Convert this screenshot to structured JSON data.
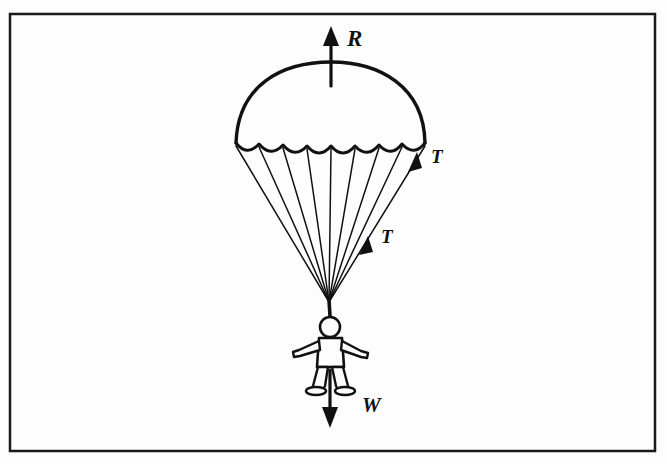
{
  "figure": {
    "background_color": "#fdfdfd",
    "ink_color": "#111111",
    "border": {
      "name": "figure-frame",
      "x": 10,
      "y": 14,
      "width": 645,
      "height": 437,
      "stroke_width": 2.5,
      "color": "#1a1a1a"
    },
    "labels": [
      {
        "id": "R",
        "text": "R",
        "x": 347,
        "y": 46,
        "meaning": "air-resistance-upward"
      },
      {
        "id": "T1",
        "text": "T",
        "x": 431,
        "y": 163,
        "meaning": "tension-in-suspension-line-upper"
      },
      {
        "id": "T2",
        "text": "T",
        "x": 381,
        "y": 243,
        "meaning": "tension-in-suspension-line-lower"
      },
      {
        "id": "W",
        "text": "W",
        "x": 362,
        "y": 412,
        "meaning": "weight-downward"
      }
    ],
    "canopy": {
      "name": "parachute-canopy",
      "apex_x": 331,
      "apex_y": 62,
      "left_x": 236,
      "right_x": 426,
      "skirt_y": 142,
      "scallop_count": 8
    },
    "lines": {
      "name": "suspension-lines",
      "count": 9,
      "converge_x": 329,
      "converge_y": 302
    },
    "arrows": {
      "resistance": {
        "name": "arrow-R",
        "x": 331,
        "y_tail": 86,
        "y_head": 28,
        "direction": "up"
      },
      "weight": {
        "name": "arrow-W",
        "x": 330,
        "y_tail": 372,
        "y_head": 427,
        "direction": "down"
      },
      "tension_upper": {
        "name": "arrow-T-upper",
        "x_head": 415,
        "y_head": 155,
        "direction": "up-right"
      },
      "tension_lower": {
        "name": "arrow-T-lower",
        "x_head": 366,
        "y_head": 240,
        "direction": "up-right"
      }
    },
    "person": {
      "name": "parachutist-figure",
      "head_center_x": 330,
      "head_center_y": 327,
      "head_radius": 10,
      "riser_top_y": 300,
      "feet_y": 393
    }
  }
}
